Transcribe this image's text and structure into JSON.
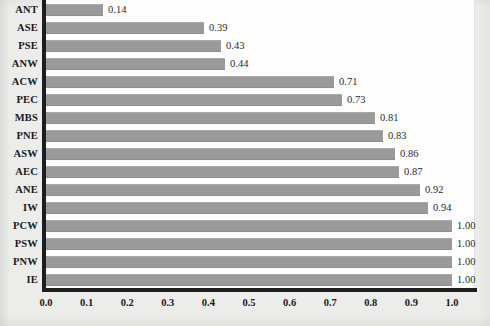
{
  "chart_data": {
    "type": "bar",
    "orientation": "horizontal",
    "title": "",
    "xlabel": "",
    "ylabel": "",
    "xlim": [
      0.0,
      1.0
    ],
    "xticks": [
      "0.0",
      "0.1",
      "0.2",
      "0.3",
      "0.4",
      "0.5",
      "0.6",
      "0.7",
      "0.8",
      "0.9",
      "1.0"
    ],
    "grid": false,
    "legend": false,
    "bar_color": "#9a9a9a",
    "axis_color": "#1d1d1d",
    "plot_background": "#fdfdfd",
    "page_background": "#ececeb",
    "categories": [
      "ANT",
      "ASE",
      "PSE",
      "ANW",
      "ACW",
      "PEC",
      "MBS",
      "PNE",
      "ASW",
      "AEC",
      "ANE",
      "IW",
      "PCW",
      "PSW",
      "PNW",
      "IE"
    ],
    "values": [
      0.14,
      0.39,
      0.43,
      0.44,
      0.71,
      0.73,
      0.81,
      0.83,
      0.86,
      0.87,
      0.92,
      0.94,
      1.0,
      1.0,
      1.0,
      1.0
    ],
    "data_labels": [
      "0.14",
      "0.39",
      "0.43",
      "0.44",
      "0.71",
      "0.73",
      "0.81",
      "0.83",
      "0.86",
      "0.87",
      "0.92",
      "0.94",
      "1.00",
      "1.00",
      "1.00",
      "1.00"
    ]
  }
}
